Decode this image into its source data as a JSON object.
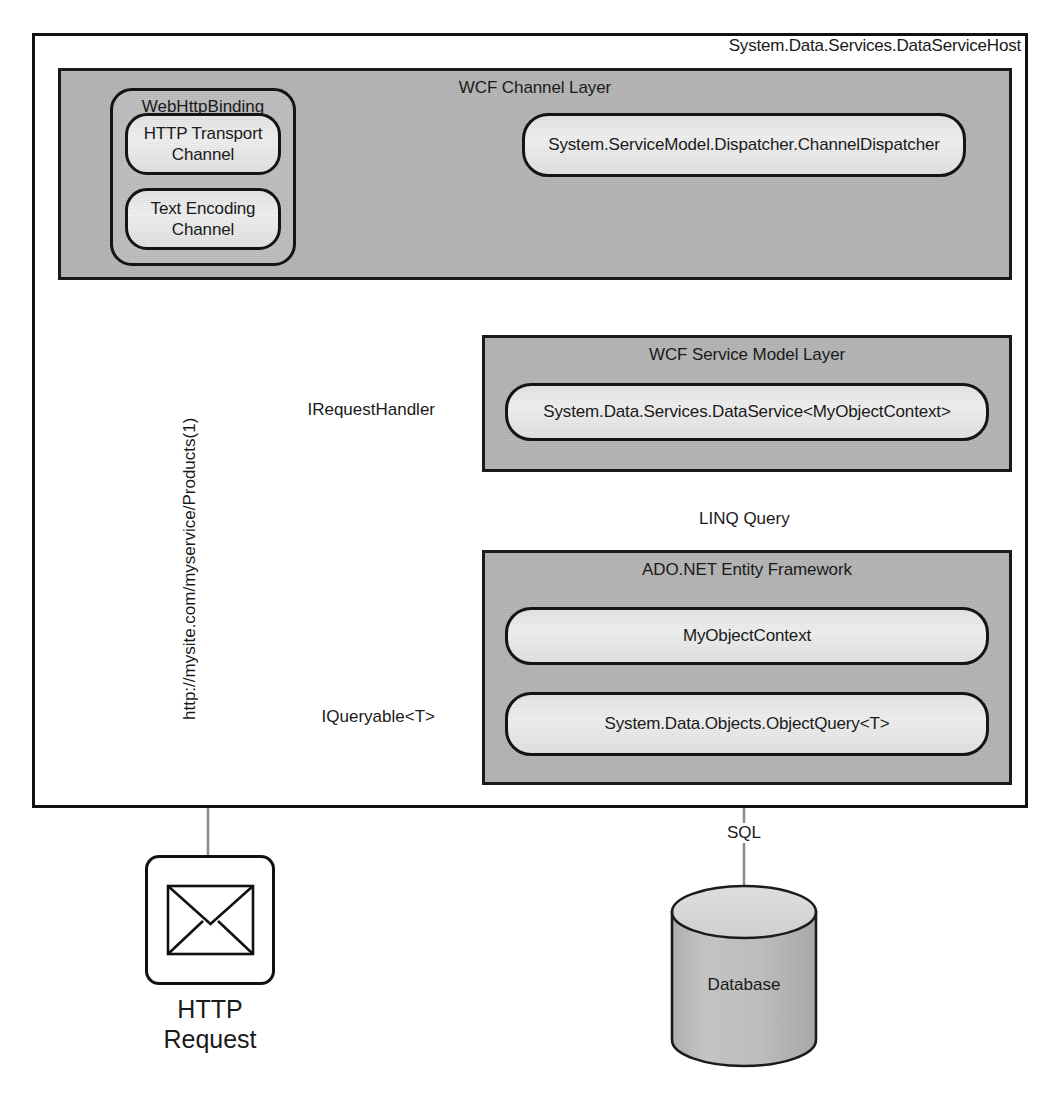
{
  "diagram": {
    "host": {
      "title": "System.Data.Services.DataServiceHost"
    },
    "layers": [
      {
        "id": "channel",
        "title": "WCF Channel Layer"
      },
      {
        "id": "servicemodel",
        "title": "WCF Service Model Layer"
      },
      {
        "id": "ef",
        "title": "ADO.NET Entity Framework"
      }
    ],
    "groups": [
      {
        "id": "binding",
        "title": "WebHttpBinding"
      }
    ],
    "components": [
      {
        "id": "http-transport-channel",
        "label": "HTTP Transport\nChannel"
      },
      {
        "id": "text-encoding-channel",
        "label": "Text Encoding\nChannel"
      },
      {
        "id": "channel-dispatcher",
        "label": "System.ServiceModel.Dispatcher.ChannelDispatcher"
      },
      {
        "id": "data-service",
        "label": "System.Data.Services.DataService<MyObjectContext>"
      },
      {
        "id": "my-object-context",
        "label": "MyObjectContext"
      },
      {
        "id": "object-query",
        "label": "System.Data.Objects.ObjectQuery<T>"
      }
    ],
    "interfaces": [
      {
        "id": "irequesthandler",
        "label": "IRequestHandler"
      },
      {
        "id": "iqueryable",
        "label": "IQueryable<T>"
      }
    ],
    "edge_labels": [
      {
        "id": "linq-query",
        "label": "LINQ Query"
      },
      {
        "id": "sql",
        "label": "SQL"
      },
      {
        "id": "request-url",
        "label": "http://mysite.com/myservice/Products(1)"
      }
    ],
    "nodes": [
      {
        "id": "http-request",
        "label_line1": "HTTP",
        "label_line2": "Request",
        "icon": "envelope-icon"
      },
      {
        "id": "database",
        "label": "Database",
        "icon": "cylinder-icon"
      }
    ],
    "colors": {
      "outline": "#111111",
      "layer_fill": "#b4b4b4",
      "group_fill": "#bdbdbd",
      "capsule_fill": "#e8e8e8",
      "connector": "#6e6e6e",
      "db_top_fill": "#d6d6d6",
      "db_body_fill": "#b8b8b8",
      "page_bg": "#ffffff"
    }
  }
}
